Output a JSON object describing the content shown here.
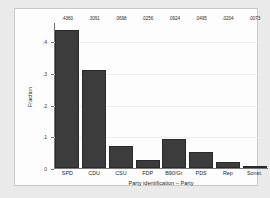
{
  "chart_data": {
    "type": "bar",
    "title": "",
    "subtitle": "",
    "xlabel": "Party identification – Party",
    "ylabel": "Fraction",
    "categories": [
      "SPD",
      "CDU",
      "CSU",
      "FDP",
      "B90/Gr.",
      "PDS",
      "Rep",
      "Sonst."
    ],
    "values": [
      0.436,
      0.3091,
      0.0698,
      0.0256,
      0.0924,
      0.0495,
      0.0204,
      0.0073
    ],
    "data_labels": [
      ".4360",
      ".3091",
      ".0698",
      ".0256",
      ".0924",
      ".0495",
      ".0204",
      ".0073"
    ],
    "ylim": [
      0,
      0.46
    ],
    "yticks": [
      0,
      0.1,
      0.2,
      0.3,
      0.4
    ],
    "ytick_labels": [
      "0",
      ".1",
      ".2",
      ".3",
      ".4"
    ],
    "grid": true,
    "legend": "none",
    "bar_color": "#3c3c3c",
    "plot_background": "#fdfdfd",
    "figure_background": "#eaeaea",
    "axis_color": "#777777",
    "grid_color": "#ededed"
  }
}
